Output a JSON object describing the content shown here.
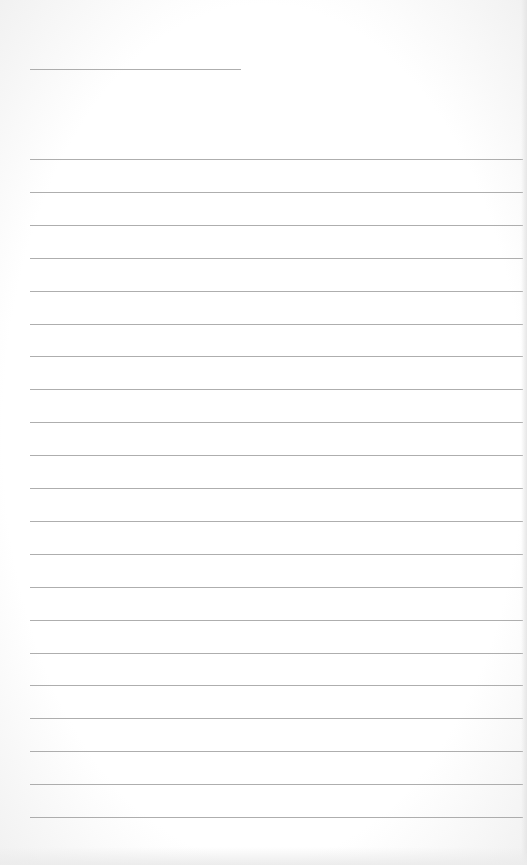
{
  "page": {
    "type": "lined-paper",
    "background_color": "#ffffff",
    "line_color": "#9a9a9a",
    "title_line": {
      "top": 69,
      "left": 30,
      "width": 211
    },
    "ruled_lines": {
      "count": 21,
      "first_top": 159,
      "spacing": 32.9,
      "left": 30,
      "width": 493
    },
    "text": ""
  }
}
